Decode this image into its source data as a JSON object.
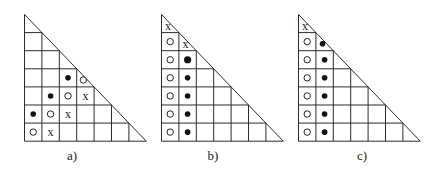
{
  "figure": {
    "grid": {
      "rows": 7,
      "cols": 7,
      "cell_w": 17.4,
      "cell_h": 18.1,
      "shape": "lower-left right triangle staircase grid"
    },
    "legend": {
      "x": "x",
      "open": "open-circle",
      "filled": "filled-dot"
    },
    "panels": [
      {
        "id": "a",
        "label": "a)",
        "origin": [
          24,
          14
        ],
        "label_pos": [
          72,
          148
        ],
        "marks": [
          {
            "row": 4,
            "col": 3,
            "type": "filled"
          },
          {
            "row": 4,
            "col": 4,
            "type": "open"
          },
          {
            "row": 5,
            "col": 2,
            "type": "filled"
          },
          {
            "row": 5,
            "col": 3,
            "type": "open"
          },
          {
            "row": 5,
            "col": 4,
            "type": "x"
          },
          {
            "row": 6,
            "col": 1,
            "type": "filled"
          },
          {
            "row": 6,
            "col": 2,
            "type": "open"
          },
          {
            "row": 6,
            "col": 3,
            "type": "x"
          },
          {
            "row": 7,
            "col": 1,
            "type": "open"
          },
          {
            "row": 7,
            "col": 2,
            "type": "x"
          }
        ]
      },
      {
        "id": "b",
        "label": "b)",
        "origin": [
          161,
          14
        ],
        "label_pos": [
          213,
          148
        ],
        "marks": [
          {
            "row": 1,
            "col": 1,
            "type": "x"
          },
          {
            "row": 2,
            "col": 1,
            "type": "open"
          },
          {
            "row": 2,
            "col": 2,
            "type": "x"
          },
          {
            "row": 3,
            "col": 1,
            "type": "open"
          },
          {
            "row": 3,
            "col": 2,
            "type": "filled",
            "size": "large"
          },
          {
            "row": 4,
            "col": 1,
            "type": "open"
          },
          {
            "row": 4,
            "col": 2,
            "type": "filled"
          },
          {
            "row": 5,
            "col": 1,
            "type": "open"
          },
          {
            "row": 5,
            "col": 2,
            "type": "filled"
          },
          {
            "row": 6,
            "col": 1,
            "type": "open"
          },
          {
            "row": 6,
            "col": 2,
            "type": "filled"
          },
          {
            "row": 7,
            "col": 1,
            "type": "open"
          },
          {
            "row": 7,
            "col": 2,
            "type": "filled"
          }
        ]
      },
      {
        "id": "c",
        "label": "c)",
        "origin": [
          298,
          14
        ],
        "label_pos": [
          362,
          148
        ],
        "marks": [
          {
            "row": 1,
            "col": 1,
            "type": "x"
          },
          {
            "row": 2,
            "col": 1,
            "type": "open"
          },
          {
            "row": 2,
            "col": 2,
            "type": "filled"
          },
          {
            "row": 3,
            "col": 1,
            "type": "open"
          },
          {
            "row": 3,
            "col": 2,
            "type": "filled"
          },
          {
            "row": 4,
            "col": 1,
            "type": "open"
          },
          {
            "row": 4,
            "col": 2,
            "type": "filled"
          },
          {
            "row": 5,
            "col": 1,
            "type": "open"
          },
          {
            "row": 5,
            "col": 2,
            "type": "filled"
          },
          {
            "row": 6,
            "col": 1,
            "type": "open"
          },
          {
            "row": 6,
            "col": 2,
            "type": "filled"
          },
          {
            "row": 7,
            "col": 1,
            "type": "open"
          },
          {
            "row": 7,
            "col": 2,
            "type": "filled"
          }
        ]
      }
    ]
  }
}
